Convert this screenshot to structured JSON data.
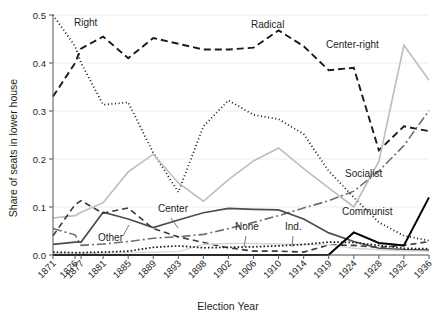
{
  "chart_data": {
    "type": "line",
    "title": "",
    "xlabel": "Election Year",
    "ylabel": "Share of seats in lower house",
    "grid": true,
    "legend_position": "inline-annotations",
    "xlim": [
      0,
      16
    ],
    "ylim": [
      0.0,
      0.5
    ],
    "yticks": [
      0.0,
      0.1,
      0.2,
      0.3,
      0.4,
      0.5
    ],
    "ytick_labels": [
      "0.0",
      "0.1",
      "0.2",
      "0.3",
      "0.4",
      "0.5"
    ],
    "categories": [
      "1871",
      "1876",
      "1877",
      "1881",
      "1885",
      "1889",
      "1893",
      "1898",
      "1902",
      "1906",
      "1910",
      "1914",
      "1919",
      "1924",
      "1928",
      "1932",
      "1936"
    ],
    "series": [
      {
        "name": "Right",
        "label": "Right",
        "color": "#1a1a1a",
        "style": "dotted",
        "width": 1.8,
        "dash": "1,2.6",
        "values": [
          0.5,
          0.435,
          0.4,
          0.313,
          0.318,
          0.213,
          0.131,
          0.268,
          0.322,
          0.292,
          0.283,
          0.252,
          0.175,
          0.12,
          0.068,
          0.04,
          0.03
        ]
      },
      {
        "name": "Radical",
        "label": "Radical",
        "color": "#1a1a1a",
        "style": "dashed",
        "width": 1.9,
        "dash": "7,4",
        "values": [
          0.33,
          0.4,
          0.43,
          0.455,
          0.41,
          0.452,
          0.44,
          0.428,
          0.428,
          0.432,
          0.468,
          0.435,
          0.385,
          0.39,
          0.218,
          0.268,
          0.258
        ]
      },
      {
        "name": "Center-right",
        "label": "Center-right",
        "color": "#bdbdbd",
        "style": "solid",
        "width": 1.6,
        "dash": "",
        "values": [
          0.077,
          0.082,
          0.089,
          0.109,
          0.173,
          0.21,
          0.15,
          0.112,
          0.157,
          0.196,
          0.223,
          0.18,
          0.14,
          0.1,
          0.195,
          0.437,
          0.364
        ]
      },
      {
        "name": "Socialist",
        "label": "Socialist",
        "color": "#6e6e6e",
        "style": "dashdot",
        "width": 1.6,
        "dash": "9,3,2,3",
        "values": [
          0.055,
          0.042,
          0.02,
          0.023,
          0.028,
          0.035,
          0.038,
          0.043,
          0.055,
          0.068,
          0.082,
          0.098,
          0.113,
          0.133,
          0.175,
          0.228,
          0.301
        ]
      },
      {
        "name": "Center",
        "label": "Center",
        "color": "#4d4d4d",
        "style": "solid",
        "width": 1.7,
        "dash": "",
        "values": [
          0.022,
          0.027,
          0.027,
          0.089,
          0.075,
          0.057,
          0.073,
          0.088,
          0.097,
          0.095,
          0.094,
          0.075,
          0.046,
          0.028,
          0.014,
          0.011,
          0.01
        ]
      },
      {
        "name": "Other",
        "label": "Other",
        "color": "#3a3a3a",
        "style": "longdash",
        "width": 1.6,
        "dash": "6,4",
        "values": [
          0.04,
          0.105,
          0.113,
          0.087,
          0.098,
          0.055,
          0.038,
          0.026,
          0.015,
          0.008,
          0.008,
          0.006,
          0.021,
          0.02,
          0.016,
          0.02,
          0.028
        ]
      },
      {
        "name": "None",
        "label": "None",
        "color": "#d6d6d6",
        "style": "solid",
        "width": 1.4,
        "dash": "",
        "values": [
          0.003,
          0.003,
          0.003,
          0.004,
          0.005,
          0.006,
          0.007,
          0.022,
          0.024,
          0.024,
          0.023,
          0.022,
          0.021,
          0.014,
          0.011,
          0.009,
          0.008
        ]
      },
      {
        "name": "Ind.",
        "label": "Ind.",
        "color": "#1a1a1a",
        "style": "densedot",
        "width": 1.7,
        "dash": "1.6,2.1",
        "values": [
          0.006,
          0.005,
          0.005,
          0.006,
          0.008,
          0.016,
          0.019,
          0.015,
          0.016,
          0.017,
          0.019,
          0.022,
          0.027,
          0.026,
          0.02,
          0.014,
          0.013
        ]
      },
      {
        "name": "Communist",
        "label": "Communist",
        "color": "#000000",
        "style": "solid",
        "width": 2.0,
        "dash": "",
        "values": [
          0.0,
          0.0,
          0.0,
          0.0,
          0.0,
          0.0,
          0.0,
          0.0,
          0.0,
          0.0,
          0.0,
          0.0,
          0.0005,
          0.047,
          0.025,
          0.02,
          0.12
        ]
      }
    ],
    "annotations": [
      {
        "text": "Right",
        "x": 74,
        "y": 26,
        "leader": null
      },
      {
        "text": "Radical",
        "x": 251,
        "y": 28,
        "leader": null
      },
      {
        "text": "Center-right",
        "x": 326,
        "y": 48,
        "leader": null
      },
      {
        "text": "Socialist",
        "x": 345,
        "y": 177,
        "leader": null
      },
      {
        "text": "Communist",
        "x": 342,
        "y": 215,
        "leader": null
      },
      {
        "text": "Center",
        "x": 158,
        "y": 212,
        "leader": "M171,218 L178,228"
      },
      {
        "text": "Other",
        "x": 98,
        "y": 241,
        "leader": "M123,236 L129,225"
      },
      {
        "text": "None",
        "x": 235,
        "y": 230,
        "leader": "M246,236 L244,247"
      },
      {
        "text": "Ind.",
        "x": 285,
        "y": 230,
        "leader": "M293,236 L292,247"
      }
    ]
  }
}
